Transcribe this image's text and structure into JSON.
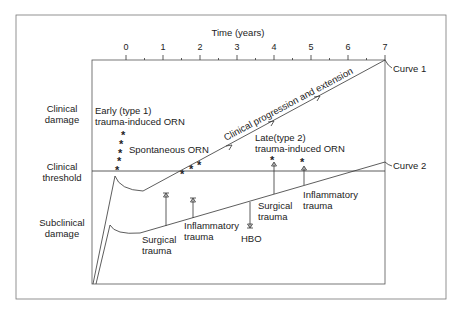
{
  "axis": {
    "title": "Time (years)",
    "ticks": [
      "0",
      "1",
      "2",
      "3",
      "4",
      "5",
      "6",
      "7"
    ]
  },
  "row_labels": {
    "clinical_damage": [
      "Clinical",
      "damage"
    ],
    "clinical_threshold": [
      "Clinical",
      "threshold"
    ],
    "subclinical_damage": [
      "Subclinical",
      "damage"
    ]
  },
  "annotations": {
    "early": [
      "Early (type 1)",
      "trauma-induced ORN"
    ],
    "spontaneous": "Spontaneous  ORN",
    "progression": "Clinical progression and extension",
    "late": [
      "Late(type 2)",
      "trauma-induced ORN"
    ],
    "curve1": "Curve 1",
    "curve2": "Curve 2",
    "surgical1": [
      "Surgical",
      "trauma"
    ],
    "inflammatory1": [
      "Inflammatory",
      "trauma"
    ],
    "hbo": "HBO",
    "surgical2": [
      "Surgical",
      "trauma"
    ],
    "inflammatory2": [
      "Inflammatory",
      "trauma"
    ],
    "star": "*"
  }
}
